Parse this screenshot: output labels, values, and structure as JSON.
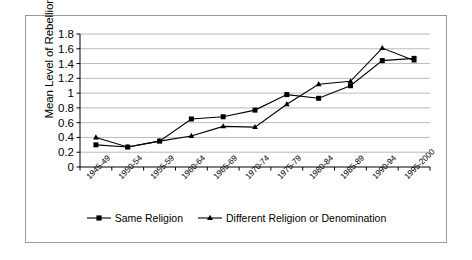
{
  "chart_data": {
    "type": "line",
    "title": "",
    "xlabel": "",
    "ylabel": "Mean Level of Rebellion",
    "ylim": [
      0,
      1.8
    ],
    "ytick_labels": [
      "0",
      "0.2",
      "0.4",
      "0.6",
      "0.8",
      "1",
      "1.2",
      "1.4",
      "1.6",
      "1.8"
    ],
    "ytick_values": [
      0,
      0.2,
      0.4,
      0.6,
      0.8,
      1.0,
      1.2,
      1.4,
      1.6,
      1.8
    ],
    "grid": true,
    "legend_position": "bottom",
    "categories": [
      "1945-49",
      "1950-54",
      "1955-59",
      "1960-64",
      "1965-69",
      "1970-74",
      "1975-79",
      "1980-84",
      "1985-89",
      "1990-94",
      "1995-2000"
    ],
    "series": [
      {
        "name": "Same Religion",
        "marker": "square",
        "color": "#000000",
        "values": [
          0.3,
          0.27,
          0.35,
          0.65,
          0.68,
          0.77,
          0.98,
          0.93,
          1.1,
          1.44,
          1.47
        ]
      },
      {
        "name": "Different Religion or Denomination",
        "marker": "triangle",
        "color": "#000000",
        "values": [
          0.4,
          0.27,
          0.35,
          0.42,
          0.55,
          0.54,
          0.85,
          1.12,
          1.16,
          1.61,
          1.44
        ]
      }
    ]
  },
  "colors": {
    "border": "#9a9a9a",
    "gridline": "#a8a8a8",
    "axis": "#000000",
    "background": "#ffffff"
  }
}
